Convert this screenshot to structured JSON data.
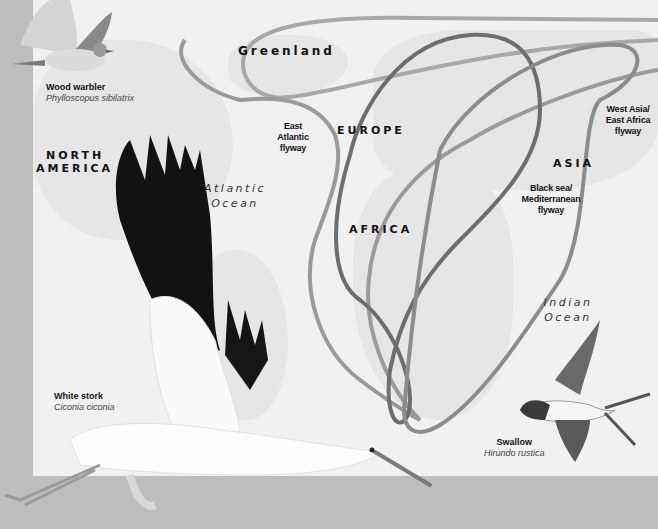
{
  "map": {
    "regions": {
      "greenland": "Greenland",
      "north_america_line1": "NORTH",
      "north_america_line2": "AMERICA",
      "europe": "EUROPE",
      "africa": "AFRICA",
      "asia": "ASIA"
    },
    "oceans": {
      "atlantic_line1": "Atlantic",
      "atlantic_line2": "Ocean",
      "indian_line1": "Indian",
      "indian_line2": "Ocean"
    },
    "flyways": [
      {
        "id": "east-atlantic",
        "lines": [
          "East",
          "Atlantic",
          "flyway"
        ],
        "color": "#9a9a9a"
      },
      {
        "id": "black-sea-mediterranean",
        "lines": [
          "Black sea/",
          "Mediterranean",
          "flyway"
        ],
        "color": "#6e6e6e"
      },
      {
        "id": "west-asia-east-africa",
        "lines": [
          "West Asia/",
          "East Africa",
          "flyway"
        ],
        "color": "#8c8c8c"
      },
      {
        "id": "northern-loop",
        "lines": [],
        "color": "#a8a8a8"
      }
    ]
  },
  "birds": [
    {
      "id": "wood-warbler",
      "name": "Wood warbler",
      "scientific": "Phylloscopus sibilatrix"
    },
    {
      "id": "white-stork",
      "name": "White stork",
      "scientific": "Ciconia ciconia"
    },
    {
      "id": "swallow",
      "name": "Swallow",
      "scientific": "Hirundo rustica"
    }
  ],
  "colors": {
    "frame": "#bdbdbd",
    "map_bg": "#f1f1f1",
    "land": "#e4e4e4",
    "text": "#111111"
  }
}
